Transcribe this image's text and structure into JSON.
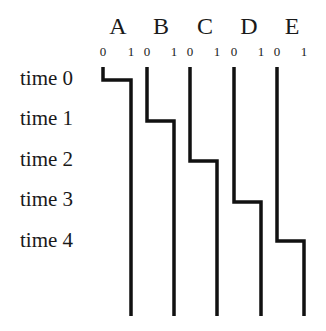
{
  "columns": [
    {
      "letter": "A",
      "tick0": "0",
      "tick1": "1"
    },
    {
      "letter": "B",
      "tick0": "0",
      "tick1": "1"
    },
    {
      "letter": "C",
      "tick0": "0",
      "tick1": "1"
    },
    {
      "letter": "D",
      "tick0": "0",
      "tick1": "1"
    },
    {
      "letter": "E",
      "tick0": "0",
      "tick1": "1"
    }
  ],
  "rows": [
    {
      "label": "time 0"
    },
    {
      "label": "time 1"
    },
    {
      "label": "time 2"
    },
    {
      "label": "time 3"
    },
    {
      "label": "time 4"
    }
  ],
  "line_color": "#111111",
  "steps": [
    {
      "column": "A",
      "x0": 103,
      "x1": 131,
      "start_y": 67,
      "switch_y": 80
    },
    {
      "column": "B",
      "x0": 147,
      "x1": 174,
      "start_y": 67,
      "switch_y": 121
    },
    {
      "column": "C",
      "x0": 190,
      "x1": 217,
      "start_y": 67,
      "switch_y": 161
    },
    {
      "column": "D",
      "x0": 234,
      "x1": 261,
      "start_y": 67,
      "switch_y": 202
    },
    {
      "column": "E",
      "x0": 277,
      "x1": 304,
      "start_y": 67,
      "switch_y": 241
    }
  ],
  "end_y": 316
}
